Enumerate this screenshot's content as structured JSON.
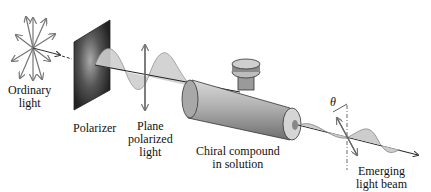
{
  "diagram": {
    "labels": {
      "ordinary_light_1": "Ordinary",
      "ordinary_light_2": "light",
      "polarizer": "Polarizer",
      "plane_1": "Plane",
      "plane_2": "polarized",
      "plane_3": "light",
      "chiral_1": "Chiral compound",
      "chiral_2": "in solution",
      "emerging_1": "Emerging",
      "emerging_2": "light beam",
      "angle": "θ"
    },
    "colors": {
      "line": "#333333",
      "wave_fill": "#c8c8c8",
      "tube": "#9a9a9a",
      "polarizer": "#3a3a3a",
      "arrow": "#777777"
    }
  }
}
